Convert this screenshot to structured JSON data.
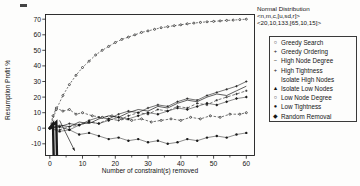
{
  "chart_data": {
    "type": "line",
    "title": "",
    "header_lines": [
      "Normal Distribution",
      "<n,m,c,[u,sd,r]>",
      "<20,10,133,[65,10,15]>"
    ],
    "xlabel": "Number of constraint(s) removed",
    "ylabel": "Resumption Profit %",
    "xlim": [
      -1.3,
      62.5
    ],
    "ylim": [
      -17.5,
      73
    ],
    "xticks": [
      0,
      10,
      20,
      30,
      40,
      50,
      60
    ],
    "xticks_minor": [
      5,
      15,
      25,
      35,
      45,
      55
    ],
    "yticks": [
      70,
      60,
      50,
      40,
      30,
      20,
      10,
      0,
      -10
    ],
    "grid": false,
    "legend_position": "right",
    "annotation": {
      "type": "arrow",
      "from": [
        3,
        5
      ],
      "to": [
        7.6,
        -14.5
      ]
    },
    "series": [
      {
        "name": "Greedy Search",
        "glyph": "○",
        "marker": "o",
        "dash": "2,1.6",
        "width": 0.6,
        "points": [
          [
            0,
            0
          ],
          [
            2,
            12
          ],
          [
            4,
            21
          ],
          [
            6,
            28
          ],
          [
            8,
            34
          ],
          [
            10,
            39
          ],
          [
            12,
            43
          ],
          [
            14,
            47
          ],
          [
            16,
            50
          ],
          [
            18,
            52.5
          ],
          [
            20,
            55
          ],
          [
            22,
            57
          ],
          [
            24,
            58.5
          ],
          [
            26,
            60
          ],
          [
            28,
            61.5
          ],
          [
            30,
            62.5
          ],
          [
            32,
            63.5
          ],
          [
            34,
            64.5
          ],
          [
            36,
            65.2
          ],
          [
            38,
            65.8
          ],
          [
            40,
            66.4
          ],
          [
            42,
            67
          ],
          [
            44,
            67.5
          ],
          [
            46,
            67.9
          ],
          [
            48,
            68.3
          ],
          [
            50,
            68.6
          ],
          [
            52,
            68.9
          ],
          [
            54,
            69.2
          ],
          [
            56,
            69.4
          ],
          [
            58,
            69.7
          ],
          [
            60,
            70
          ]
        ]
      },
      {
        "name": "Greedy Ordering",
        "glyph": "+",
        "marker": "plus",
        "dash": null,
        "width": 0.6,
        "points": [
          [
            0,
            0
          ],
          [
            3,
            1
          ],
          [
            6,
            3
          ],
          [
            9,
            2
          ],
          [
            12,
            5
          ],
          [
            15,
            7
          ],
          [
            18,
            6
          ],
          [
            21,
            9
          ],
          [
            24,
            11
          ],
          [
            27,
            10
          ],
          [
            30,
            13
          ],
          [
            33,
            15
          ],
          [
            36,
            14
          ],
          [
            39,
            17
          ],
          [
            42,
            19
          ],
          [
            45,
            18
          ],
          [
            48,
            21
          ],
          [
            51,
            23
          ],
          [
            54,
            25
          ],
          [
            57,
            27
          ],
          [
            60,
            30
          ]
        ]
      },
      {
        "name": "High Node Degree",
        "glyph": "−",
        "marker": "",
        "dash": null,
        "width": 0.7,
        "points": [
          [
            0,
            0
          ],
          [
            3,
            2
          ],
          [
            6,
            1
          ],
          [
            9,
            4
          ],
          [
            12,
            3
          ],
          [
            15,
            6
          ],
          [
            18,
            8
          ],
          [
            21,
            7
          ],
          [
            24,
            10
          ],
          [
            27,
            12
          ],
          [
            30,
            11
          ],
          [
            33,
            14
          ],
          [
            36,
            13
          ],
          [
            39,
            16
          ],
          [
            42,
            18
          ],
          [
            45,
            17
          ],
          [
            48,
            20
          ],
          [
            51,
            22
          ],
          [
            54,
            21
          ],
          [
            57,
            24
          ],
          [
            60,
            27
          ]
        ]
      },
      {
        "name": "High Tightness",
        "glyph": "+",
        "marker": "plus",
        "dash": "3,1.8",
        "width": 0.6,
        "points": [
          [
            0,
            0
          ],
          [
            3,
            -1
          ],
          [
            6,
            1
          ],
          [
            9,
            2
          ],
          [
            12,
            4
          ],
          [
            15,
            3
          ],
          [
            18,
            6
          ],
          [
            21,
            5
          ],
          [
            24,
            8
          ],
          [
            27,
            10
          ],
          [
            30,
            9
          ],
          [
            33,
            12
          ],
          [
            36,
            11
          ],
          [
            39,
            14
          ],
          [
            42,
            13
          ],
          [
            45,
            16
          ],
          [
            48,
            15
          ],
          [
            51,
            18
          ],
          [
            54,
            20
          ],
          [
            57,
            22
          ],
          [
            60,
            24
          ]
        ]
      },
      {
        "name": "Isolate High Nodes",
        "glyph": "",
        "marker": "",
        "dash": null,
        "width": 2.4,
        "points": [
          [
            0,
            0
          ],
          [
            1,
            3
          ],
          [
            1.2,
            -19
          ]
        ]
      },
      {
        "name": "Isolate Low Nodes",
        "glyph": "▲",
        "marker": "",
        "dash": null,
        "width": 2.4,
        "points": [
          [
            0,
            0
          ],
          [
            2,
            4
          ],
          [
            2.2,
            -19
          ]
        ]
      },
      {
        "name": "Low Node Degree",
        "glyph": "○",
        "marker": "o",
        "dash": "2.5,1.6",
        "width": 0.6,
        "points": [
          [
            0,
            0
          ],
          [
            1,
            8
          ],
          [
            2,
            13
          ],
          [
            4,
            11
          ],
          [
            6,
            12
          ],
          [
            8,
            9
          ],
          [
            10,
            10
          ],
          [
            13,
            8
          ],
          [
            16,
            7
          ],
          [
            19,
            8
          ],
          [
            22,
            6
          ],
          [
            25,
            5
          ],
          [
            28,
            6
          ],
          [
            31,
            4
          ],
          [
            34,
            5
          ],
          [
            37,
            6
          ],
          [
            40,
            5
          ],
          [
            43,
            7
          ],
          [
            46,
            6
          ],
          [
            49,
            8
          ],
          [
            52,
            7
          ],
          [
            55,
            9
          ],
          [
            58,
            9
          ],
          [
            60,
            10
          ]
        ]
      },
      {
        "name": "Low Tightness",
        "glyph": "●",
        "marker": "dot",
        "dash": null,
        "width": 0.5,
        "points": [
          [
            0,
            0
          ],
          [
            3,
            -2
          ],
          [
            6,
            -1
          ],
          [
            9,
            -4
          ],
          [
            12,
            -3
          ],
          [
            15,
            -5
          ],
          [
            18,
            -7
          ],
          [
            21,
            -6
          ],
          [
            24,
            -8
          ],
          [
            27,
            -7
          ],
          [
            30,
            -9
          ],
          [
            33,
            -8
          ],
          [
            36,
            -10
          ],
          [
            39,
            -9
          ],
          [
            42,
            -7
          ],
          [
            45,
            -8
          ],
          [
            48,
            -6
          ],
          [
            51,
            -5
          ],
          [
            54,
            -6
          ],
          [
            57,
            -4
          ],
          [
            60,
            -3
          ]
        ]
      },
      {
        "name": "Random Removal",
        "glyph": "◆",
        "marker": "dia",
        "dash": null,
        "width": 0.5,
        "points": [
          [
            0,
            0
          ],
          [
            3,
            1
          ],
          [
            6,
            -1
          ],
          [
            9,
            2
          ],
          [
            12,
            4
          ],
          [
            15,
            3
          ],
          [
            18,
            5
          ],
          [
            21,
            7
          ],
          [
            24,
            6
          ],
          [
            27,
            8
          ],
          [
            30,
            10
          ],
          [
            33,
            9
          ],
          [
            36,
            11
          ],
          [
            39,
            13
          ],
          [
            42,
            12
          ],
          [
            45,
            14
          ],
          [
            48,
            16
          ],
          [
            51,
            15
          ],
          [
            54,
            17
          ],
          [
            57,
            19
          ],
          [
            60,
            20
          ]
        ]
      }
    ]
  }
}
